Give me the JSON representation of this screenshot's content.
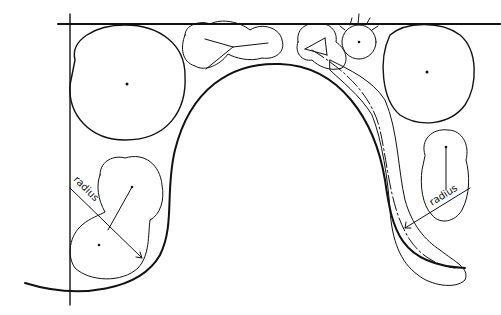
{
  "diagram": {
    "type": "landscape-planting-plan-sketch",
    "labels": {
      "left_radius": "radius",
      "right_radius": "radius"
    },
    "colors": {
      "ink": "#111111",
      "background": "#ffffff"
    },
    "elements": [
      "property-boundary-top",
      "property-boundary-left",
      "curved-bed-edge",
      "large-tree-top-left",
      "large-tree-top-right",
      "shrub-group-top-center-left",
      "shrub-group-top-center-right",
      "small-spiky-tree-top",
      "shrub-group-left-bottom",
      "shrub-drift-right-bed",
      "shrub-group-right-lower",
      "radius-dimension-left",
      "radius-dimension-right"
    ]
  }
}
